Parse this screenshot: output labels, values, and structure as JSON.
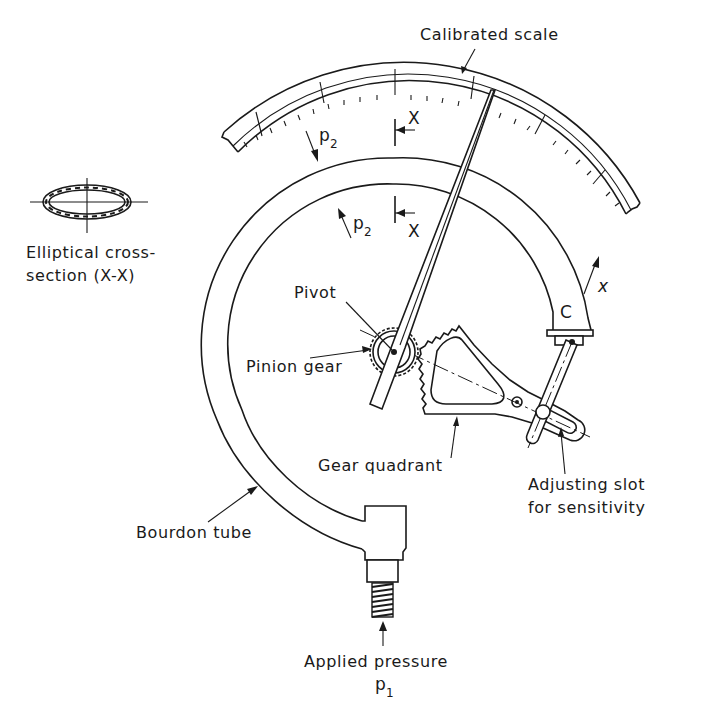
{
  "diagram": {
    "colors": {
      "ink": "#1a1a1a",
      "background": "#ffffff"
    },
    "labels": {
      "calibrated_scale": "Calibrated scale",
      "cross_section_line1": "Elliptical cross-",
      "cross_section_line2": "section (X-X)",
      "pivot": "Pivot",
      "pinion_gear": "Pinion gear",
      "gear_quadrant": "Gear quadrant",
      "adjusting_slot_line1": "Adjusting slot",
      "adjusting_slot_line2": "for sensitivity",
      "bourdon_tube": "Bourdon tube",
      "applied_pressure": "Applied pressure",
      "p1_symbol": "p",
      "p1_subscript": "1",
      "p2_outer_symbol": "p",
      "p2_outer_subscript": "2",
      "p2_inner_symbol": "p",
      "p2_inner_subscript": "2",
      "section_mark_top": "X",
      "section_mark_bottom": "X",
      "tip_label": "C",
      "displacement_symbol": "x"
    },
    "components": [
      "calibrated-scale",
      "pointer",
      "bourdon-tube",
      "pinion-gear",
      "gear-quadrant",
      "connecting-link",
      "adjusting-slot",
      "socket-fitting",
      "elliptical-cross-section"
    ]
  }
}
